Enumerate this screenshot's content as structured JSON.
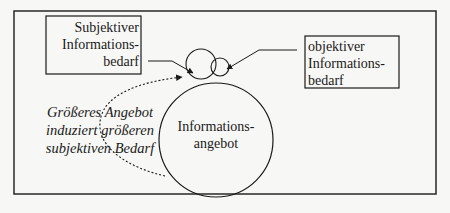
{
  "diagram": {
    "subjective_need": {
      "lines": [
        "Subjektiver",
        "Informations-",
        "bedarf"
      ]
    },
    "objective_need": {
      "lines": [
        "objektiver",
        "Informations-",
        "bedarf"
      ]
    },
    "information_supply": {
      "lines": [
        "Informations-",
        "angebot"
      ]
    },
    "induction_note": {
      "lines": [
        "Größeres Angebot",
        "induziert größeren",
        "subjektiven Bedarf"
      ]
    },
    "colors": {
      "stroke": "#1a1a1a",
      "background": "#f7f7f5"
    }
  }
}
